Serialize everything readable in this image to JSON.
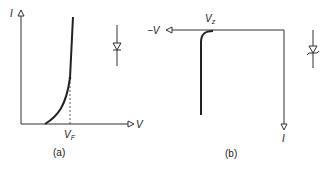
{
  "panels": [
    {
      "id": "a",
      "caption": "(a)",
      "y_axis_label": "I",
      "x_axis_label": "V",
      "marker_label": "V",
      "marker_subscript": "F",
      "symbol": "diode-forward",
      "description": "Forward-biased diode I-V characteristic"
    },
    {
      "id": "b",
      "caption": "(b)",
      "x_axis_label": "−V",
      "y_axis_label": "I",
      "marker_label": "V",
      "marker_subscript": "z",
      "symbol": "zener-diode",
      "description": "Zener diode reverse breakdown characteristic"
    }
  ],
  "colors": {
    "line": "#222222",
    "background": "#ffffff"
  }
}
